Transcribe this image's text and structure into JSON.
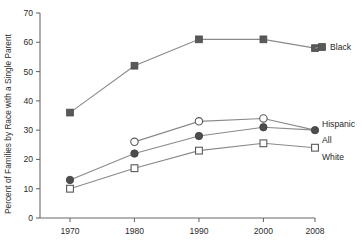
{
  "chart_data": {
    "type": "line",
    "title": "",
    "xlabel": "",
    "ylabel": "Percent of Families by Race with a Single Parent",
    "x": [
      1970,
      1980,
      1990,
      2000,
      2008
    ],
    "xtick_labels": [
      "1970",
      "1980",
      "1990",
      "2000",
      "2008"
    ],
    "ytick_labels": [
      "0",
      "10",
      "20",
      "30",
      "40",
      "50",
      "60",
      "70"
    ],
    "yticks": [
      0,
      10,
      20,
      30,
      40,
      50,
      60,
      70
    ],
    "ylim": [
      0,
      70
    ],
    "xlim": [
      1965,
      2012
    ],
    "grid": false,
    "legend_position": "right-inline-end-of-line",
    "series": [
      {
        "name": "Black",
        "marker": "filled-square",
        "color": "#595959",
        "values": [
          36,
          52,
          61,
          61,
          58
        ]
      },
      {
        "name": "Hispanic",
        "marker": "open-circle",
        "color": "#ffffff",
        "values": [
          null,
          26,
          33,
          34,
          30
        ]
      },
      {
        "name": "All",
        "marker": "filled-circle",
        "color": "#4d4d4d",
        "values": [
          13,
          22,
          28,
          31,
          30
        ]
      },
      {
        "name": "White",
        "marker": "open-square",
        "color": "#ffffff",
        "values": [
          10,
          17,
          23,
          25.5,
          24
        ]
      }
    ]
  }
}
